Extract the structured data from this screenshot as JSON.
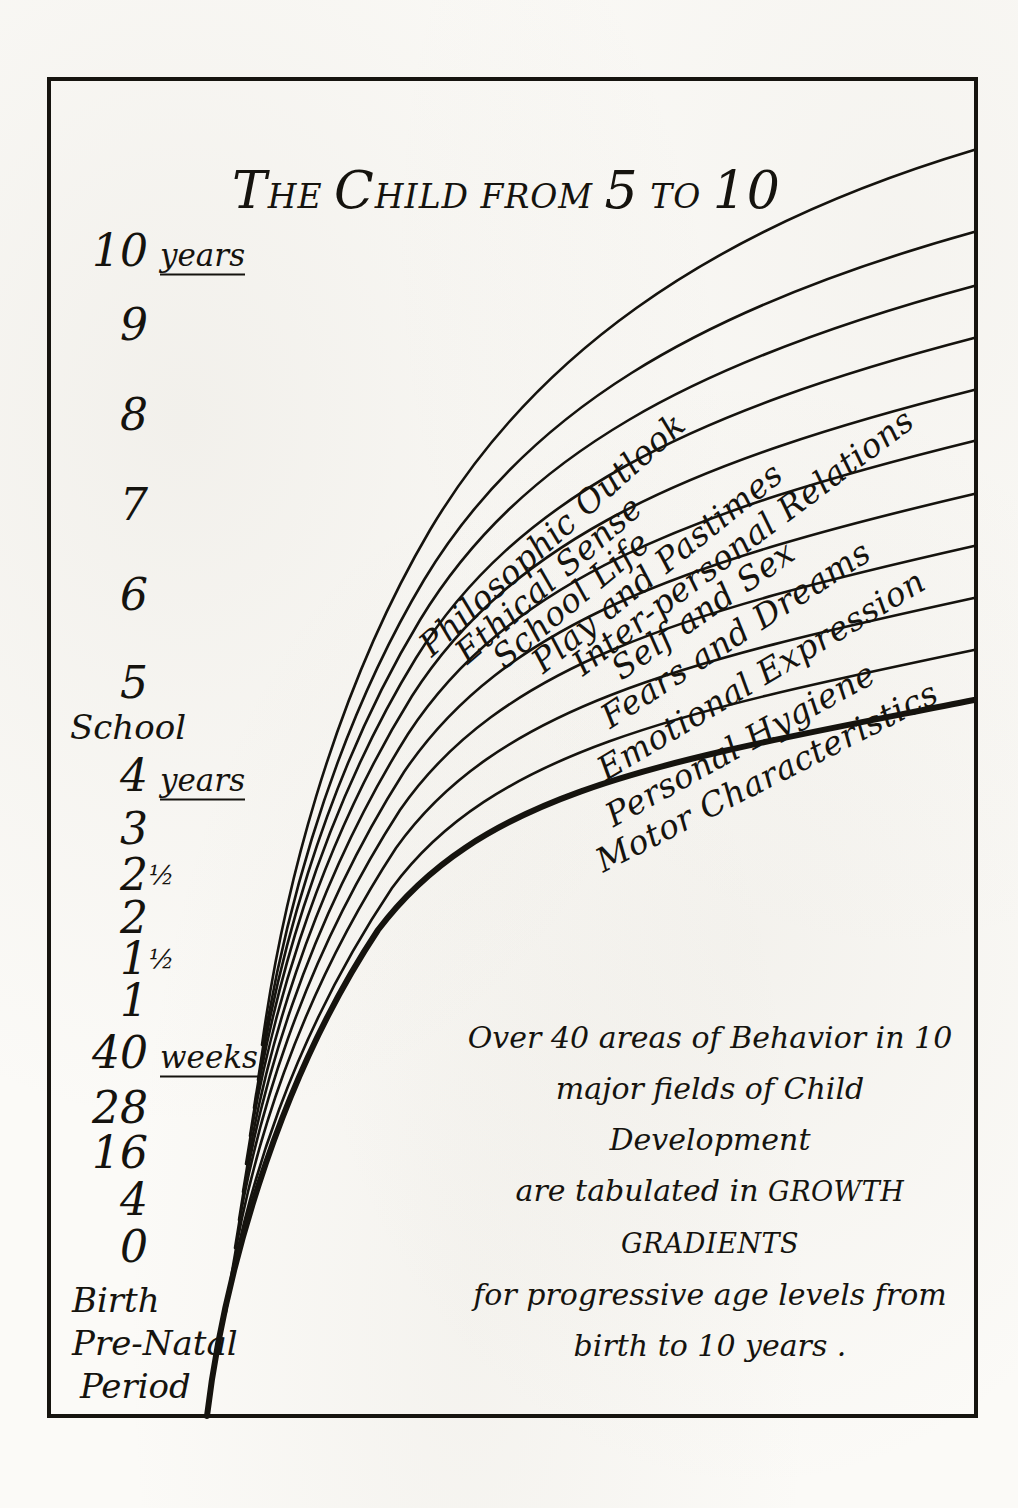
{
  "title": {
    "lead": "T",
    "lead_rest": "HE ",
    "word2_lead": "C",
    "word2_rest": "HILD ",
    "from": "FROM ",
    "five": "5",
    "to": " TO ",
    "ten": "10",
    "plain": "The Child from 5 to 10"
  },
  "y_axis": {
    "ticks": [
      {
        "num": "10",
        "unit": "years",
        "y": 250
      },
      {
        "num": "9",
        "unit": "",
        "y": 324
      },
      {
        "num": "8",
        "unit": "",
        "y": 414
      },
      {
        "num": "7",
        "unit": "",
        "y": 504
      },
      {
        "num": "6",
        "unit": "",
        "y": 594
      },
      {
        "num": "5",
        "unit": "",
        "y": 682
      },
      {
        "num": "4",
        "unit": "years",
        "y": 775
      },
      {
        "num": "3",
        "unit": "",
        "y": 828
      },
      {
        "num": "2",
        "frac": "½",
        "unit": "",
        "y": 874
      },
      {
        "num": "2",
        "unit": "",
        "y": 917
      },
      {
        "num": "1",
        "frac": "½",
        "unit": "",
        "y": 958
      },
      {
        "num": "1",
        "unit": "",
        "y": 1000
      },
      {
        "num": "40",
        "unit": "weeks",
        "y": 1052
      },
      {
        "num": "28",
        "unit": "",
        "y": 1107
      },
      {
        "num": "16",
        "unit": "",
        "y": 1152
      },
      {
        "num": "4",
        "unit": "",
        "y": 1199
      },
      {
        "num": "0",
        "unit": "",
        "y": 1246
      }
    ],
    "words": [
      {
        "text": "School",
        "y": 727,
        "x": 70
      },
      {
        "text": "Birth",
        "y": 1300,
        "x": 72
      },
      {
        "text": "Pre-Natal",
        "y": 1343,
        "x": 72
      },
      {
        "text": "Period",
        "y": 1386,
        "x": 80
      }
    ]
  },
  "chart_data": {
    "type": "line",
    "title": "The Child from 5 to 10",
    "xlabel": "",
    "ylabel": "Age",
    "grid": false,
    "legend": "inline-curve-labels",
    "y_tick_labels": [
      "10 years",
      "9",
      "8",
      "7",
      "6",
      "5",
      "School",
      "4 years",
      "3",
      "2½",
      "2",
      "1½",
      "1",
      "40 weeks",
      "28",
      "16",
      "4",
      "0",
      "Birth",
      "Pre-Natal Period"
    ],
    "series": [
      {
        "name": "Philosophic Outlook",
        "index": 1,
        "right_edge_y": 150,
        "label_angle": -41
      },
      {
        "name": "Ethical Sense",
        "index": 2,
        "right_edge_y": 232,
        "label_angle": -41
      },
      {
        "name": "School Life",
        "index": 3,
        "right_edge_y": 286,
        "label_angle": -41
      },
      {
        "name": "Play and Pastimes",
        "index": 4,
        "right_edge_y": 338,
        "label_angle": -38
      },
      {
        "name": "Inter-personal Relations",
        "index": 5,
        "right_edge_y": 390,
        "label_angle": -36
      },
      {
        "name": "Self and Sex",
        "index": 6,
        "right_edge_y": 441,
        "label_angle": -34
      },
      {
        "name": "Fears and Dreams",
        "index": 7,
        "right_edge_y": 494,
        "label_angle": -32
      },
      {
        "name": "Emotional Expression",
        "index": 8,
        "right_edge_y": 546,
        "label_angle": -30
      },
      {
        "name": "Personal Hygiene",
        "index": 9,
        "right_edge_y": 598,
        "label_angle": -28
      },
      {
        "name": "Motor Characteristics",
        "index": 10,
        "right_edge_y": 650,
        "label_angle": -26
      },
      {
        "name": "baseline",
        "index": 11,
        "right_edge_y": 700,
        "label_angle": 0
      }
    ]
  },
  "curve_labels": [
    {
      "text": "Philosophic Outlook",
      "x": 424,
      "y": 630,
      "angle": -42
    },
    {
      "text": "Ethical Sense",
      "x": 460,
      "y": 637,
      "angle": -41
    },
    {
      "text": "School Life",
      "x": 497,
      "y": 642,
      "angle": -40
    },
    {
      "text": "Play and Pastimes",
      "x": 536,
      "y": 646,
      "angle": -39
    },
    {
      "text": "Inter-personal Relations",
      "x": 576,
      "y": 648,
      "angle": -37
    },
    {
      "text": "Self and Sex",
      "x": 615,
      "y": 652,
      "angle": -35
    },
    {
      "text": "Fears and Dreams",
      "x": 604,
      "y": 700,
      "angle": -33
    },
    {
      "text": "Emotional Expression",
      "x": 600,
      "y": 752,
      "angle": -31
    },
    {
      "text": "Personal Hygiene",
      "x": 608,
      "y": 798,
      "angle": -29
    },
    {
      "text": "Motor Characteristics",
      "x": 598,
      "y": 843,
      "angle": -27
    }
  ],
  "caption": {
    "line1": "Over 40 areas of Behavior in 10",
    "line2": "major fields of Child Development",
    "line3_a": "are tabulated in ",
    "line3_caps": "GROWTH GRADIENTS",
    "line4": "for progressive age levels from",
    "line5": "birth to 10 years ."
  },
  "colors": {
    "ink": "#15130e",
    "paper": "#fbfaf7",
    "frame": "#16140f"
  }
}
